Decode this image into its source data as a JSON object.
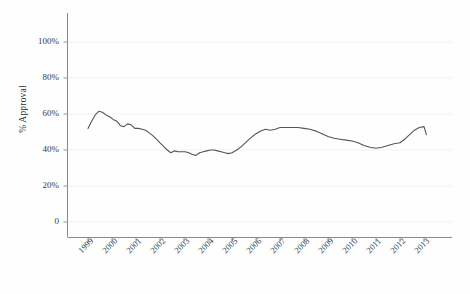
{
  "chart_data": {
    "type": "line",
    "title": "",
    "xlabel": "",
    "ylabel": "% Approval",
    "xlim": [
      1998.9,
      2013.3
    ],
    "ylim": [
      0,
      110
    ],
    "grid": true,
    "grid_orientation": "horizontal",
    "legend": "none",
    "line_color": "#555555",
    "x_tick_labels": [
      "1999",
      "2000",
      "2001",
      "2002",
      "2003",
      "2004",
      "2005",
      "2006",
      "2007",
      "2008",
      "2009",
      "2010",
      "2011",
      "2012",
      "2013"
    ],
    "x_ticks": [
      1999,
      2000,
      2001,
      2002,
      2003,
      2004,
      2005,
      2006,
      2007,
      2008,
      2009,
      2010,
      2011,
      2012,
      2013
    ],
    "y_tick_labels": [
      "0",
      "20%",
      "40%",
      "60%",
      "80%",
      "100%"
    ],
    "y_ticks": [
      0,
      20,
      40,
      60,
      80,
      100
    ],
    "series": [
      {
        "name": "% Approval",
        "x": [
          1999.0,
          1999.15,
          1999.3,
          1999.45,
          1999.6,
          1999.75,
          1999.9,
          2000.05,
          2000.2,
          2000.35,
          2000.5,
          2000.65,
          2000.8,
          2000.95,
          2001.1,
          2001.25,
          2001.4,
          2001.55,
          2001.7,
          2001.85,
          2002.0,
          2002.15,
          2002.3,
          2002.45,
          2002.6,
          2002.75,
          2002.9,
          2003.05,
          2003.2,
          2003.35,
          2003.5,
          2003.65,
          2003.8,
          2003.95,
          2004.1,
          2004.25,
          2004.4,
          2004.55,
          2004.7,
          2004.85,
          2005.0,
          2005.2,
          2005.4,
          2005.6,
          2005.8,
          2006.0,
          2006.2,
          2006.4,
          2006.6,
          2006.8,
          2007.0,
          2007.25,
          2007.5,
          2007.75,
          2008.0,
          2008.25,
          2008.5,
          2008.75,
          2009.0,
          2009.25,
          2009.5,
          2009.75,
          2010.0,
          2010.25,
          2010.5,
          2010.75,
          2011.0,
          2011.25,
          2011.5,
          2011.75,
          2012.0,
          2012.2,
          2012.4,
          2012.6,
          2012.8,
          2013.0,
          2013.1
        ],
        "y": [
          52.0,
          56.0,
          59.5,
          61.5,
          61.0,
          59.5,
          58.5,
          57.0,
          56.0,
          53.5,
          53.0,
          54.5,
          54.0,
          52.0,
          52.0,
          51.5,
          51.0,
          49.5,
          48.0,
          46.0,
          44.0,
          42.0,
          40.0,
          38.5,
          39.5,
          39.0,
          39.0,
          39.0,
          38.5,
          37.5,
          37.0,
          38.5,
          39.0,
          39.5,
          40.0,
          40.0,
          39.5,
          39.0,
          38.5,
          38.0,
          38.5,
          40.0,
          42.0,
          44.5,
          47.0,
          49.0,
          50.5,
          51.5,
          51.0,
          51.5,
          52.5,
          52.5,
          52.5,
          52.5,
          52.0,
          51.5,
          50.5,
          49.0,
          47.5,
          46.5,
          46.0,
          45.5,
          45.0,
          44.0,
          42.5,
          41.5,
          41.0,
          41.5,
          42.5,
          43.5,
          44.0,
          46.0,
          48.5,
          51.0,
          52.5,
          53.0,
          48.5
        ]
      }
    ]
  }
}
